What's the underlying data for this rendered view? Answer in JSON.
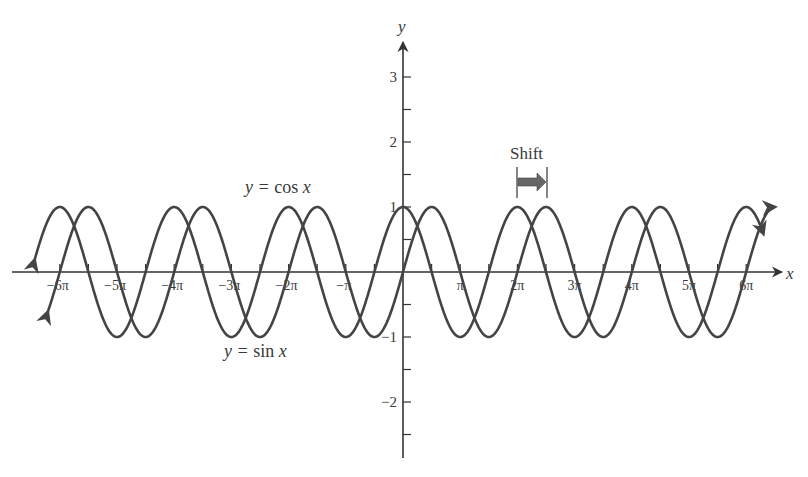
{
  "chart_data": {
    "type": "line",
    "title": "",
    "xlabel": "x",
    "ylabel": "y",
    "xlim": [
      -6.45,
      6.3
    ],
    "xlim_units": "pi",
    "ylim": [
      -2.9,
      3.6
    ],
    "x_ticks_every": "pi/2",
    "y_ticks_every": 0.5,
    "x_tick_labels": [
      {
        "k": -6,
        "text": "−6π"
      },
      {
        "k": -5,
        "text": "−5π"
      },
      {
        "k": -4,
        "text": "−4π"
      },
      {
        "k": -3,
        "text": "−3π"
      },
      {
        "k": -2,
        "text": "−2π"
      },
      {
        "k": -1,
        "text": "−π"
      },
      {
        "k": 1,
        "text": "π"
      },
      {
        "k": 2,
        "text": "2π"
      },
      {
        "k": 3,
        "text": "3π"
      },
      {
        "k": 4,
        "text": "4π"
      },
      {
        "k": 5,
        "text": "5π"
      },
      {
        "k": 6,
        "text": "6π"
      }
    ],
    "y_tick_labels": [
      {
        "v": 3,
        "text": "3"
      },
      {
        "v": 2,
        "text": "2"
      },
      {
        "v": 1,
        "text": "1"
      },
      {
        "v": -1,
        "text": "−1"
      },
      {
        "v": -2,
        "text": "−2"
      }
    ],
    "series": [
      {
        "name": "y = cos x",
        "function": "cos",
        "x_start_pi": -6.44,
        "x_end_pi": 6.3,
        "color": "#444444"
      },
      {
        "name": "y = sin x",
        "function": "sin",
        "x_start_pi": -6.21,
        "x_end_pi": 6.5,
        "color": "#444444"
      }
    ],
    "annotations": [
      {
        "text": "y = cos x",
        "near": "cos curve, above, around x = -2.5π"
      },
      {
        "text": "y = sin x",
        "near": "sin curve, below, around x = -3π"
      },
      {
        "text": "Shift",
        "description": "arrow from 2π to 2π + π/2 showing horizontal shift of π/2 between cos and sin"
      }
    ],
    "grid": false,
    "legend": "none"
  },
  "labels": {
    "x_axis": "x",
    "y_axis": "y",
    "cos_label_y": "y = ",
    "cos_label_fn": "cos ",
    "cos_label_x": "x",
    "sin_label_y": "y = ",
    "sin_label_fn": "sin ",
    "sin_label_x": "x",
    "shift": "Shift"
  },
  "colors": {
    "curve": "#444444",
    "axis": "#333333",
    "text": "#3a3a3a",
    "shift_arrow": "#555555"
  }
}
